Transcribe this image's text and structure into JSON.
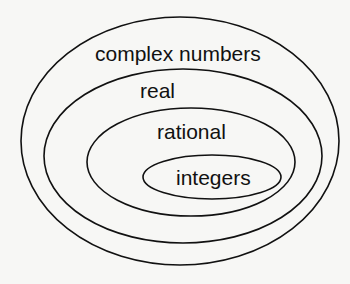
{
  "diagram": {
    "type": "nested-sets",
    "colors": {
      "background": "#f7f7f5",
      "stroke": "#111111",
      "text": "#111111"
    },
    "sets": [
      {
        "label": "complex numbers"
      },
      {
        "label": "real"
      },
      {
        "label": "rational"
      },
      {
        "label": "integers"
      }
    ]
  }
}
